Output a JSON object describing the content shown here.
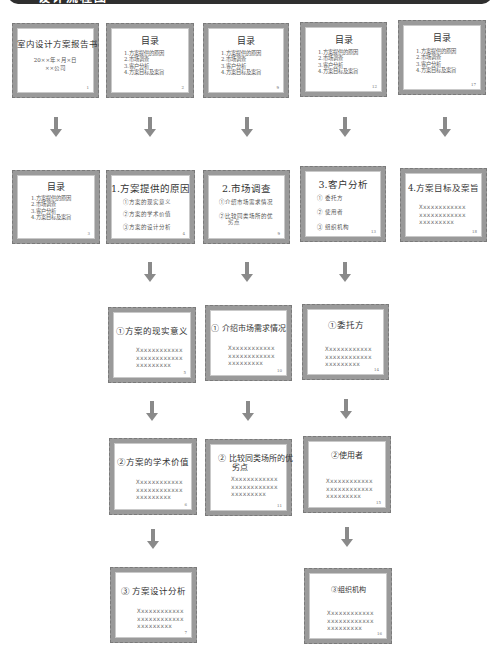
{
  "header": {
    "title": "设计流程图"
  },
  "row1": [
    {
      "title": "室内设计方案报告书",
      "subtitle": [
        "20××年×月×日",
        "××公司"
      ],
      "page": "1"
    },
    {
      "title": "目录",
      "items": [
        "1.方案提供的原因",
        "2.市场调查",
        "3.客户分析",
        "4.方案目标及案旨"
      ],
      "page": "2"
    },
    {
      "title": "目录",
      "items": [
        "1.方案提供的原因",
        "2.市场调查",
        "3.客户分析",
        "4.方案目标及案旨"
      ],
      "page": "9"
    },
    {
      "title": "目录",
      "items": [
        "1.方案提供的原因",
        "2.市场调查",
        "3.客户分析",
        "4.方案目标及案旨"
      ],
      "page": "12"
    },
    {
      "title": "目录",
      "items": [
        "1.方案提供的原因",
        "2.市场调查",
        "3.客户分析",
        "4.方案目标及案旨"
      ],
      "page": "17"
    }
  ],
  "row2": [
    {
      "title": "目录",
      "items": [
        "1.方案提供的原因",
        "2.市场调查",
        "3.客户分析",
        "4.方案目标及案旨"
      ],
      "page": "3"
    },
    {
      "title": "1.方案提供的原因",
      "items": [
        "①方案的现实意义",
        "②方案的学术价值",
        "③方案的设计分析"
      ],
      "page": "4"
    },
    {
      "title": "2.市场调查",
      "items": [
        "①介绍市场需求情况",
        "②比较同类场所的优",
        "劣点"
      ],
      "page": "9"
    },
    {
      "title": "3.客户分析",
      "items": [
        "① 委托方",
        "② 使用者",
        "③ 组织机构"
      ],
      "page": "13"
    },
    {
      "title": "4.方案目标及案旨",
      "xlines": [
        "Xxxxxxxxxxxx",
        "xxxxxxxxxxxx",
        "xxxxxxxxx"
      ],
      "page": "18"
    }
  ],
  "row3": [
    {
      "title": "①方案的现实意义",
      "xlines": [
        "Xxxxxxxxxxxx",
        "xxxxxxxxxxxx",
        "xxxxxxxxx"
      ],
      "page": "5"
    },
    {
      "title": "① 介绍市场需求情况",
      "xlines": [
        "Xxxxxxxxxxxx",
        "xxxxxxxxxxxx",
        "xxxxxxxxx"
      ],
      "page": "10"
    },
    {
      "title": "①委托方",
      "xlines": [
        "Xxxxxxxxxxxx",
        "xxxxxxxxxxxx",
        "xxxxxxxxx"
      ],
      "page": "14"
    }
  ],
  "row4": [
    {
      "title": "②方案的学术价值",
      "xlines": [
        "Xxxxxxxxxxxx",
        "xxxxxxxxxxxx",
        "xxxxxxxxx"
      ],
      "page": "6"
    },
    {
      "title": [
        "② 比较同类场所的优",
        "劣点"
      ],
      "xlines": [
        "Xxxxxxxxxxxx",
        "xxxxxxxxxxxx",
        "xxxxxxxxx"
      ],
      "page": "11"
    },
    {
      "title": "②使用者",
      "xlines": [
        "Xxxxxxxxxxxx",
        "xxxxxxxxxxxx",
        "xxxxxxxxx"
      ],
      "page": "15"
    }
  ],
  "row5": [
    {
      "title": "③ 方案设计分析",
      "xlines": [
        "Xxxxxxxxxxxx",
        "xxxxxxxxxxxx",
        "xxxxxxxxx"
      ],
      "page": "7"
    },
    {
      "title": "③组织机构",
      "xlines": [
        "Xxxxxxxxxxxx",
        "xxxxxxxxxxxx",
        "xxxxxxxxx"
      ],
      "page": "16"
    }
  ],
  "colors": {
    "frame": "#9a9a9a",
    "arrow": "#8a8a8a",
    "header": "#2f2f2f"
  }
}
